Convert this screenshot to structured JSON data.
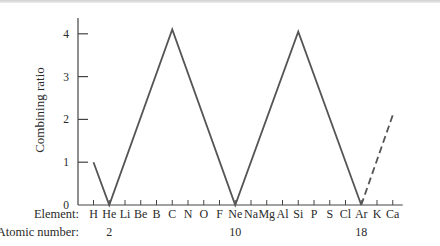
{
  "chart_data": {
    "type": "line",
    "title": "",
    "xlabel": "Element:",
    "secondary_xlabel": "Atomic number:",
    "ylabel": "Combining ratio",
    "ylim": [
      0,
      4.3
    ],
    "yticks": [
      0,
      1,
      2,
      3,
      4
    ],
    "grid": false,
    "legend": "none",
    "categories": [
      "H",
      "He",
      "Li",
      "Be",
      "B",
      "C",
      "N",
      "O",
      "F",
      "Ne",
      "Na",
      "Mg",
      "Al",
      "Si",
      "P",
      "S",
      "Cl",
      "Ar",
      "K",
      "Ca"
    ],
    "atomic_number_labels": [
      {
        "element": "He",
        "label": "2"
      },
      {
        "element": "Ne",
        "label": "10"
      },
      {
        "element": "Ar",
        "label": "18"
      }
    ],
    "series": [
      {
        "name": "observed",
        "style": "solid",
        "points": [
          {
            "x": "H",
            "y": 1
          },
          {
            "x": "He",
            "y": 0
          },
          {
            "x": "C",
            "y": 4.1
          },
          {
            "x": "Ne",
            "y": 0
          },
          {
            "x": "Si",
            "y": 4.05
          },
          {
            "x": "Ar",
            "y": 0
          }
        ]
      },
      {
        "name": "extrapolated",
        "style": "dashed",
        "points": [
          {
            "x": "Ar",
            "y": 0
          },
          {
            "x": "Ca",
            "y": 2.1
          }
        ]
      }
    ],
    "colors": {
      "line": "#555555",
      "axis": "#444444",
      "text": "#2a2a2a"
    }
  }
}
